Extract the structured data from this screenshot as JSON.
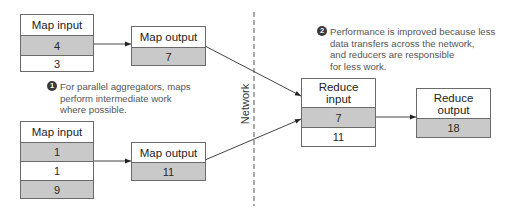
{
  "map_groups": [
    {
      "input": {
        "title": "Map input",
        "values": [
          "4",
          "3"
        ]
      },
      "output": {
        "title": "Map output",
        "value": "7"
      }
    },
    {
      "input": {
        "title": "Map input",
        "values": [
          "1",
          "1",
          "9"
        ]
      },
      "output": {
        "title": "Map output",
        "value": "11"
      }
    }
  ],
  "network_label": "Network",
  "reduce_input": {
    "title_line1": "Reduce",
    "title_line2": "input",
    "values": [
      "7",
      "11"
    ]
  },
  "reduce_output": {
    "title_line1": "Reduce",
    "title_line2": "output",
    "value": "18"
  },
  "annotations": [
    {
      "number": "1",
      "lines": [
        "For parallel aggregators, maps",
        "perform intermediate work",
        "where possible."
      ]
    },
    {
      "number": "2",
      "lines": [
        "Performance is improved because less",
        "data transfers across the network,",
        "and reducers are responsible",
        "for less work."
      ]
    }
  ],
  "colors": {
    "shade": "#c9c9c9",
    "border": "#6a6a6a",
    "annotation_text": "#555555",
    "arrow": "#333333"
  }
}
